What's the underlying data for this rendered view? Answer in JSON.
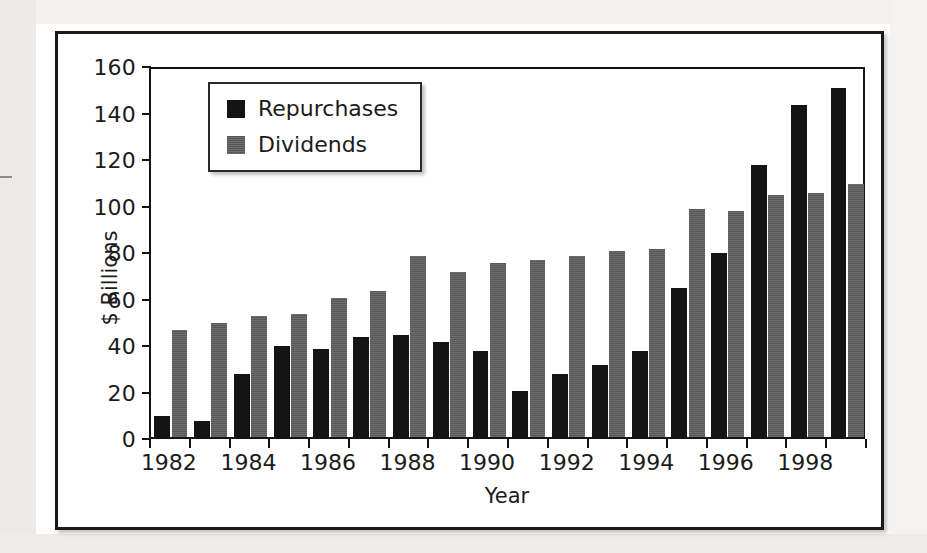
{
  "chart_data": {
    "type": "bar",
    "title": "",
    "xlabel": "Year",
    "ylabel": "$ Billions",
    "ylim": [
      0,
      160
    ],
    "ytick_values": [
      0,
      20,
      40,
      60,
      80,
      100,
      120,
      140,
      160
    ],
    "ytick_labels": [
      "0",
      "20",
      "40",
      "60",
      "80",
      "100",
      "120",
      "140",
      "160"
    ],
    "grid": false,
    "legend_position": "upper-left-inside",
    "categories": [
      "1982",
      "1983",
      "1984",
      "1985",
      "1986",
      "1987",
      "1988",
      "1989",
      "1990",
      "1991",
      "1992",
      "1993",
      "1994",
      "1995",
      "1996",
      "1997",
      "1998",
      "1999"
    ],
    "xtick_labels_shown": [
      "1982",
      "1984",
      "1986",
      "1988",
      "1990",
      "1992",
      "1994",
      "1996",
      "1998"
    ],
    "series": [
      {
        "name": "Repurchases",
        "color": "#141414",
        "values": [
          9,
          7,
          27,
          39,
          38,
          43,
          44,
          41,
          37,
          20,
          27,
          31,
          37,
          64,
          79,
          117,
          143,
          150
        ]
      },
      {
        "name": "Dividends",
        "color": "#636363",
        "values": [
          46,
          49,
          52,
          53,
          60,
          63,
          78,
          71,
          75,
          76,
          78,
          80,
          81,
          98,
          97,
          104,
          105,
          109
        ]
      }
    ]
  },
  "legend": {
    "items": [
      {
        "label": "Repurchases",
        "swatch": "black-square-swatch"
      },
      {
        "label": "Dividends",
        "swatch": "gray-square-swatch"
      }
    ]
  },
  "axes": {
    "y_title": "$ Billions",
    "x_title": "Year"
  }
}
